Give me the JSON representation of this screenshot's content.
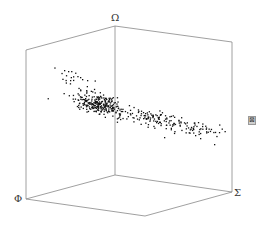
{
  "chart_data": {
    "type": "scatter",
    "dimensions": 3,
    "title": "",
    "axis_labels": {
      "x": "Φ",
      "y": "Σ",
      "z": "Ω"
    },
    "tick_labels": [],
    "grid": false,
    "legend": null,
    "box_vertices": {
      "top_back": [
        115,
        26
      ],
      "top_left": [
        26,
        50
      ],
      "top_right": [
        232,
        42
      ],
      "bottom_left": [
        26,
        199
      ],
      "bottom_right": [
        232,
        192
      ],
      "bottom_back": [
        115,
        175
      ],
      "bottom_front": [
        145,
        216
      ]
    },
    "point_cloud": {
      "description": "Dense elongated cluster descending from upper-left to lower-right",
      "seed": 7,
      "clusters": [
        {
          "cx": 98,
          "cy": 103,
          "sx": 12,
          "sy": 5,
          "n": 260,
          "slope": 0.22
        },
        {
          "cx": 150,
          "cy": 118,
          "sx": 22,
          "sy": 4,
          "n": 120,
          "slope": 0.2
        },
        {
          "cx": 195,
          "cy": 128,
          "sx": 14,
          "sy": 3,
          "n": 50,
          "slope": 0.15
        },
        {
          "cx": 72,
          "cy": 77,
          "sx": 6,
          "sy": 4,
          "n": 14,
          "slope": 0.3
        }
      ],
      "outliers": [
        [
          64,
          70
        ],
        [
          68,
          71
        ],
        [
          70,
          80
        ],
        [
          80,
          77
        ],
        [
          82,
          79
        ],
        [
          87,
          80
        ],
        [
          214,
          144
        ],
        [
          164,
          137
        ],
        [
          195,
          135
        ],
        [
          200,
          138
        ]
      ]
    }
  },
  "labels": {
    "omega": "Ω",
    "phi": "Φ",
    "sigma": "Σ"
  },
  "toolbar": {
    "icon_glyph": "⊠"
  }
}
